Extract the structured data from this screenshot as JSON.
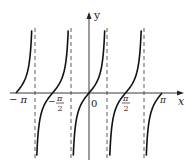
{
  "chart_data": {
    "type": "line",
    "title": "",
    "function": "y = tan(2x)",
    "xlabel": "x",
    "ylabel": "y",
    "xlim": [
      -3.1416,
      3.1416
    ],
    "x_tick_labels": [
      "-π",
      "-π/2",
      "0",
      "π/2",
      "π"
    ],
    "x_tick_values": [
      -3.1416,
      -1.5708,
      0,
      1.5708,
      3.1416
    ],
    "asymptotes": [
      -2.3562,
      -0.7854,
      0.7854,
      2.3562
    ],
    "asymptote_style": "dashed",
    "zeros": [
      -3.1416,
      -1.5708,
      0,
      1.5708,
      3.1416
    ],
    "grid": false,
    "legend": null
  },
  "labels": {
    "x_axis": "x",
    "y_axis": "y",
    "origin": "0",
    "neg_pi": "− π",
    "neg_half_pi_num": "π",
    "neg_half_pi_den": "2",
    "half_pi_num": "π",
    "half_pi_den": "2",
    "pi": "π",
    "neg_sign": "−"
  }
}
